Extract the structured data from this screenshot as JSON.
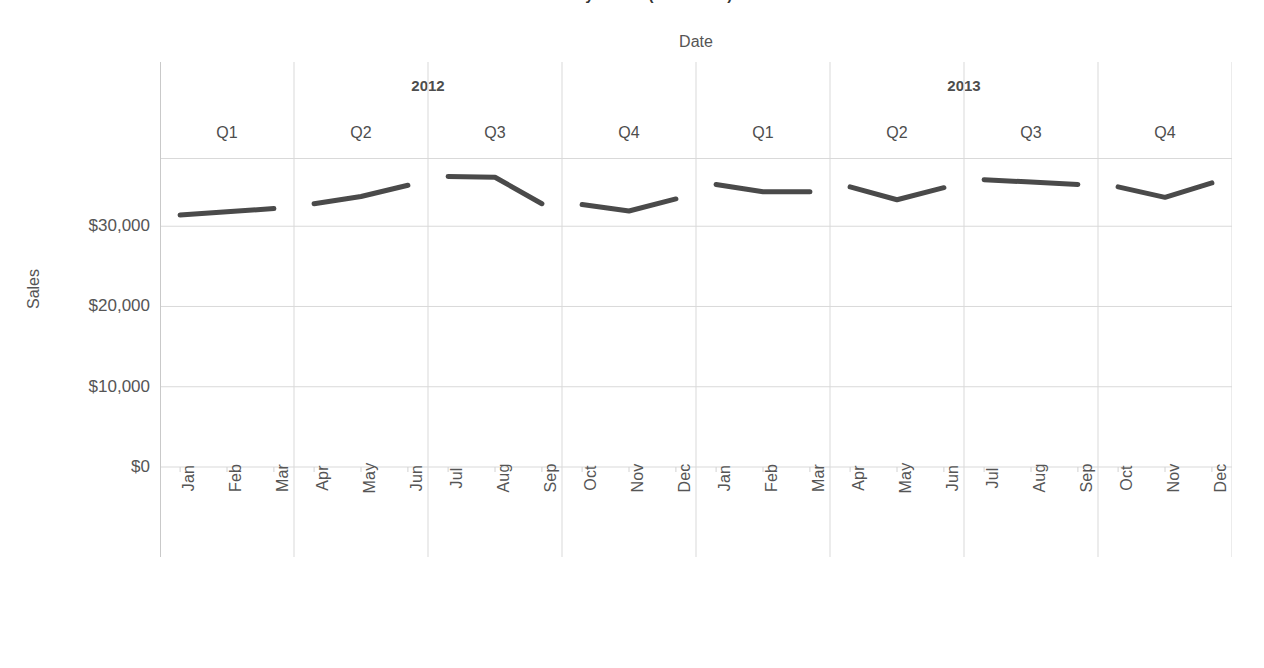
{
  "chart_title": "Sales by Month (2012-2013)",
  "axes": {
    "x_title": "Date",
    "y_title": "Sales",
    "y_ticks": [
      "$30,000",
      "$20,000",
      "$10,000",
      "$0"
    ]
  },
  "header": {
    "years": [
      "2012",
      "2013"
    ],
    "quarters": [
      "Q1",
      "Q2",
      "Q3",
      "Q4",
      "Q1",
      "Q2",
      "Q3",
      "Q4"
    ]
  },
  "colors": {
    "line": "#4a4a4a",
    "gridline": "#d9d9d9",
    "axis_text": "#555555",
    "header_text": "#4d4d4d",
    "background": "#ffffff"
  },
  "chart_data": {
    "type": "line",
    "title": "Sales by Month (2012-2013)",
    "xlabel": "Date",
    "ylabel": "Sales",
    "ylim": [
      0,
      38500
    ],
    "y_tick_values": [
      0,
      10000,
      20000,
      30000
    ],
    "y_tick_labels": [
      "$0",
      "$10,000",
      "$20,000",
      "$30,000"
    ],
    "grid": true,
    "legend": "none",
    "panel_breaks": "quarter",
    "categories": [
      "2012 Q1 Jan",
      "2012 Q1 Feb",
      "2012 Q1 Mar",
      "2012 Q2 Apr",
      "2012 Q2 May",
      "2012 Q2 Jun",
      "2012 Q3 Jul",
      "2012 Q3 Aug",
      "2012 Q3 Sep",
      "2012 Q4 Oct",
      "2012 Q4 Nov",
      "2012 Q4 Dec",
      "2013 Q1 Jan",
      "2013 Q1 Feb",
      "2013 Q1 Mar",
      "2013 Q2 Apr",
      "2013 Q2 May",
      "2013 Q2 Jun",
      "2013 Q3 Jul",
      "2013 Q3 Aug",
      "2013 Q3 Sep",
      "2013 Q4 Oct",
      "2013 Q4 Nov",
      "2013 Q4 Dec"
    ],
    "x_tick_labels": [
      "Jan",
      "Feb",
      "Mar",
      "Apr",
      "May",
      "Jun",
      "Jul",
      "Aug",
      "Sep",
      "Oct",
      "Nov",
      "Dec",
      "Jan",
      "Feb",
      "Mar",
      "Apr",
      "May",
      "Jun",
      "Jul",
      "Aug",
      "Sep",
      "Oct",
      "Nov",
      "Dec"
    ],
    "series": [
      {
        "name": "Sales",
        "color": "#4a4a4a",
        "values": [
          31400,
          31800,
          32200,
          32800,
          33700,
          35100,
          36200,
          36100,
          32800,
          32700,
          31900,
          33400,
          35200,
          34300,
          34300,
          34900,
          33300,
          34800,
          35800,
          35500,
          35200,
          34900,
          33600,
          35400
        ]
      }
    ]
  }
}
